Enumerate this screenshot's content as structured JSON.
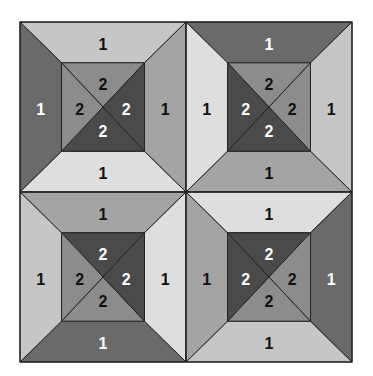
{
  "diagram": {
    "bounds": {
      "x0": 20,
      "y0": 22,
      "x1": 352,
      "y1": 362
    },
    "inner_inset_ratio": {
      "x": 0.25,
      "y": 0.24
    },
    "colors": {
      "lightest": "#dedede",
      "light": "#c6c6c6",
      "medium": "#a4a4a4",
      "medium_dark": "#8c8c8c",
      "dark": "#6a6a6a",
      "darkest": "#4a4a4a",
      "line": "#222222",
      "label_dark": "#111111",
      "label_light": "#ffffff"
    },
    "blocks": [
      {
        "id": "top-left",
        "outer": {
          "top": {
            "label": "1",
            "fill": "light"
          },
          "left": {
            "label": "1",
            "fill": "dark"
          },
          "right": {
            "label": "1",
            "fill": "medium"
          },
          "bottom": {
            "label": "1",
            "fill": "lightest"
          }
        },
        "inner": {
          "top": {
            "label": "2",
            "fill": "medium_dark"
          },
          "left": {
            "label": "2",
            "fill": "medium_dark"
          },
          "right": {
            "label": "2",
            "fill": "darkest"
          },
          "bottom": {
            "label": "2",
            "fill": "darkest"
          }
        }
      },
      {
        "id": "top-right",
        "outer": {
          "top": {
            "label": "1",
            "fill": "dark"
          },
          "left": {
            "label": "1",
            "fill": "lightest"
          },
          "right": {
            "label": "1",
            "fill": "light"
          },
          "bottom": {
            "label": "1",
            "fill": "medium"
          }
        },
        "inner": {
          "top": {
            "label": "2",
            "fill": "medium_dark"
          },
          "left": {
            "label": "2",
            "fill": "darkest"
          },
          "right": {
            "label": "2",
            "fill": "medium_dark"
          },
          "bottom": {
            "label": "2",
            "fill": "darkest"
          }
        }
      },
      {
        "id": "bottom-left",
        "outer": {
          "top": {
            "label": "1",
            "fill": "medium"
          },
          "left": {
            "label": "1",
            "fill": "light"
          },
          "right": {
            "label": "1",
            "fill": "lightest"
          },
          "bottom": {
            "label": "1",
            "fill": "dark"
          }
        },
        "inner": {
          "top": {
            "label": "2",
            "fill": "darkest"
          },
          "left": {
            "label": "2",
            "fill": "medium_dark"
          },
          "right": {
            "label": "2",
            "fill": "darkest"
          },
          "bottom": {
            "label": "2",
            "fill": "medium_dark"
          }
        }
      },
      {
        "id": "bottom-right",
        "outer": {
          "top": {
            "label": "1",
            "fill": "lightest"
          },
          "left": {
            "label": "1",
            "fill": "medium"
          },
          "right": {
            "label": "1",
            "fill": "dark"
          },
          "bottom": {
            "label": "1",
            "fill": "light"
          }
        },
        "inner": {
          "top": {
            "label": "2",
            "fill": "darkest"
          },
          "left": {
            "label": "2",
            "fill": "darkest"
          },
          "right": {
            "label": "2",
            "fill": "medium_dark"
          },
          "bottom": {
            "label": "2",
            "fill": "medium_dark"
          }
        }
      }
    ]
  }
}
